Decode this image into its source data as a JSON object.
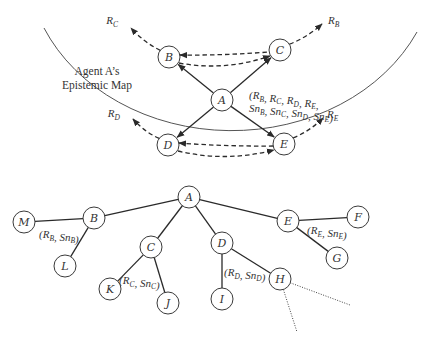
{
  "map": {
    "title_line1": "Agent A’s",
    "title_line2": "Epistemic Map",
    "nodes": [
      {
        "id": "A",
        "label": "A",
        "x": 222,
        "y": 100
      },
      {
        "id": "B",
        "label": "B",
        "x": 169,
        "y": 57
      },
      {
        "id": "C",
        "label": "C",
        "x": 280,
        "y": 50
      },
      {
        "id": "D",
        "label": "D",
        "x": 168,
        "y": 145
      },
      {
        "id": "E",
        "label": "E",
        "x": 284,
        "y": 144
      }
    ],
    "solid_arrows": [
      {
        "from": "A",
        "to": "B"
      },
      {
        "from": "A",
        "to": "C"
      },
      {
        "from": "A",
        "to": "D"
      },
      {
        "from": "A",
        "to": "E"
      }
    ],
    "dashed_links": [
      {
        "from": "B",
        "to": "C"
      },
      {
        "from": "D",
        "to": "E"
      }
    ],
    "external_arrows": [
      {
        "from": "B",
        "label": "R",
        "sub": "C",
        "tx": 131,
        "ty": 28,
        "lx": 118,
        "ly": 24
      },
      {
        "from": "C",
        "label": "R",
        "sub": "B",
        "tx": 322,
        "ty": 24,
        "lx": 328,
        "ly": 24
      },
      {
        "from": "D",
        "label": "R",
        "sub": "D",
        "tx": 133,
        "ty": 119,
        "lx": 120,
        "ly": 117
      },
      {
        "from": "E",
        "label": "R",
        "sub": "E",
        "tx": 323,
        "ty": 118,
        "lx": 327,
        "ly": 118
      }
    ],
    "annotation": {
      "line1": [
        [
          "(R",
          "B"
        ],
        [
          ", R",
          "C"
        ],
        [
          ", R",
          "D"
        ],
        [
          ", R",
          "E"
        ],
        [
          ",",
          ""
        ]
      ],
      "line2": [
        [
          "Sn",
          "B"
        ],
        [
          ", Sn",
          "C"
        ],
        [
          ", Sn",
          "D"
        ],
        [
          ", Sn",
          "E"
        ],
        [
          ")",
          ""
        ]
      ]
    }
  },
  "tree": {
    "nodes": [
      {
        "id": "A",
        "label": "A",
        "x": 189,
        "y": 197
      },
      {
        "id": "B",
        "label": "B",
        "x": 94,
        "y": 218
      },
      {
        "id": "M",
        "label": "M",
        "x": 24,
        "y": 222
      },
      {
        "id": "L",
        "label": "L",
        "x": 65,
        "y": 266
      },
      {
        "id": "C",
        "label": "C",
        "x": 151,
        "y": 247
      },
      {
        "id": "K",
        "label": "K",
        "x": 110,
        "y": 289
      },
      {
        "id": "J",
        "label": "J",
        "x": 168,
        "y": 303
      },
      {
        "id": "D",
        "label": "D",
        "x": 222,
        "y": 243
      },
      {
        "id": "I",
        "label": "I",
        "x": 222,
        "y": 299
      },
      {
        "id": "H",
        "label": "H",
        "x": 280,
        "y": 279
      },
      {
        "id": "E",
        "label": "E",
        "x": 288,
        "y": 221
      },
      {
        "id": "F",
        "label": "F",
        "x": 358,
        "y": 217
      },
      {
        "id": "G",
        "label": "G",
        "x": 337,
        "y": 258
      }
    ],
    "edges": [
      [
        "A",
        "B"
      ],
      [
        "B",
        "M"
      ],
      [
        "B",
        "L"
      ],
      [
        "A",
        "C"
      ],
      [
        "C",
        "K"
      ],
      [
        "C",
        "J"
      ],
      [
        "A",
        "D"
      ],
      [
        "D",
        "I"
      ],
      [
        "D",
        "H"
      ],
      [
        "A",
        "E"
      ],
      [
        "E",
        "F"
      ],
      [
        "E",
        "G"
      ]
    ],
    "dotted_edges": [
      {
        "from": "H",
        "x": 350,
        "y": 305
      },
      {
        "from": "H",
        "x": 297,
        "y": 332
      }
    ],
    "annotations": [
      {
        "x": 39,
        "y": 238,
        "parts": [
          [
            "(R",
            "B"
          ],
          [
            ", Sn",
            "B"
          ],
          [
            ")",
            ""
          ]
        ]
      },
      {
        "x": 119,
        "y": 284,
        "parts": [
          [
            "(R",
            "C"
          ],
          [
            ", Sn",
            "C"
          ],
          [
            ")",
            ""
          ]
        ]
      },
      {
        "x": 224,
        "y": 276,
        "parts": [
          [
            "(R",
            "D"
          ],
          [
            ", Sn",
            "D"
          ],
          [
            ")",
            ""
          ]
        ]
      },
      {
        "x": 307,
        "y": 234,
        "parts": [
          [
            "(R",
            "E"
          ],
          [
            ", Sn",
            "E"
          ],
          [
            ")",
            ""
          ]
        ]
      }
    ]
  },
  "arc": {
    "start": [
      44,
      28
    ],
    "end": [
      417,
      32
    ],
    "rx": 205,
    "ry": 172
  }
}
